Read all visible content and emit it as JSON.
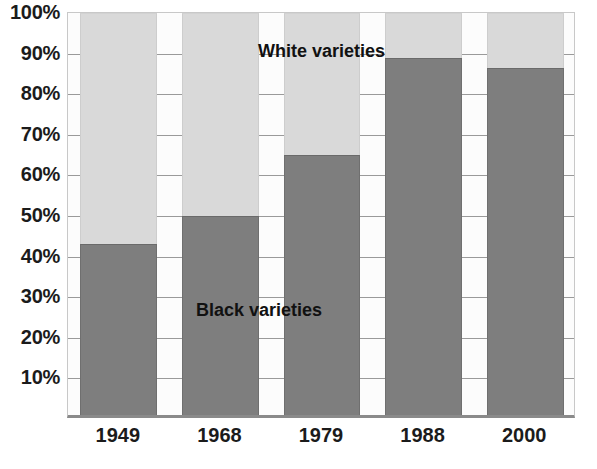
{
  "chart_data": {
    "type": "bar",
    "subtype": "stacked-100-percent",
    "title": "",
    "subtitle": "",
    "xlabel": "",
    "ylabel": "",
    "categories": [
      "1949",
      "1968",
      "1979",
      "1988",
      "2000"
    ],
    "series": [
      {
        "name": "Black varieties",
        "color": "#7e7e7e",
        "values": [
          43,
          50,
          65,
          89,
          86.5
        ]
      },
      {
        "name": "White varieties",
        "color": "#d9d9d9",
        "values": [
          57,
          50,
          35,
          11,
          13.5
        ]
      }
    ],
    "ylim": [
      0,
      100
    ],
    "ytick_labels": [
      "10%",
      "20%",
      "30%",
      "40%",
      "50%",
      "60%",
      "70%",
      "80%",
      "90%",
      "100%"
    ],
    "ytick_values": [
      10,
      20,
      30,
      40,
      50,
      60,
      70,
      80,
      90,
      100
    ],
    "grid": true,
    "grid_axis": "y",
    "legend_position": "inside-annotations",
    "annotations": [
      {
        "name": "white-varieties",
        "text": "White varieties",
        "series": "White varieties"
      },
      {
        "name": "black-varieties",
        "text": "Black varieties",
        "series": "Black varieties"
      }
    ]
  },
  "axes": {
    "y": {
      "ticks": [
        {
          "label": "100%",
          "value": 100
        },
        {
          "label": "90%",
          "value": 90
        },
        {
          "label": "80%",
          "value": 80
        },
        {
          "label": "70%",
          "value": 70
        },
        {
          "label": "60%",
          "value": 60
        },
        {
          "label": "50%",
          "value": 50
        },
        {
          "label": "40%",
          "value": 40
        },
        {
          "label": "30%",
          "value": 30
        },
        {
          "label": "20%",
          "value": 20
        },
        {
          "label": "10%",
          "value": 10
        }
      ]
    },
    "x": {
      "ticks": [
        {
          "label": "1949"
        },
        {
          "label": "1968"
        },
        {
          "label": "1979"
        },
        {
          "label": "1988"
        },
        {
          "label": "2000"
        }
      ]
    }
  },
  "colors": {
    "black_varieties": "#7e7e7e",
    "white_varieties": "#d9d9d9",
    "gridline": "#9a9a9a",
    "plot_background": "#fcfcfc",
    "axis_line": "#8a8a8a",
    "text": "#1b1b1b"
  }
}
